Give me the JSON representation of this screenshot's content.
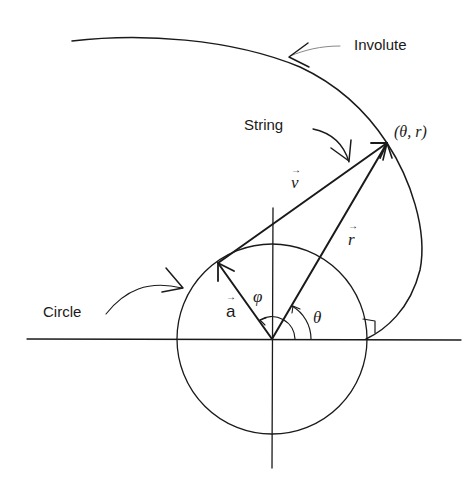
{
  "labels": {
    "involute": "Involute",
    "string": "String",
    "circle": "Circle",
    "point": "(θ, r)",
    "vec_v": "v",
    "vec_r": "r",
    "vec_a": "a",
    "angle_phi": "φ",
    "angle_theta": "θ",
    "vec_arrow": "→"
  }
}
